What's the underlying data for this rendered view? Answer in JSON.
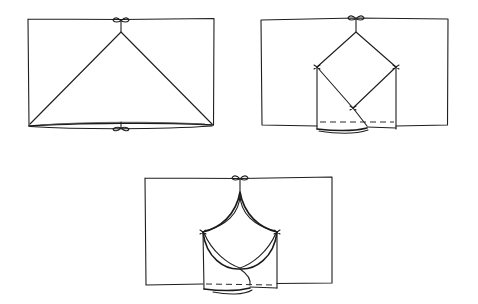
{
  "diagram": {
    "title": "",
    "style": "hand-drawn line sketch",
    "colors": {
      "ink": "#1e1e1e",
      "background": "#ffffff"
    },
    "steps": [
      {
        "id": "step-1",
        "label": "",
        "description": "Rectangle with triangle drawn from top-center bow to both bottom corners; bows at top and bottom center",
        "frame": {
          "x": 28,
          "y": 19,
          "w": 186,
          "h": 107
        },
        "shape": "triangle",
        "points": {
          "apex": [
            121,
            32
          ],
          "left": [
            30,
            124
          ],
          "right": [
            212,
            124
          ]
        },
        "bows": [
          {
            "x": 121,
            "y": 19,
            "position": "top"
          },
          {
            "x": 121,
            "y": 128,
            "position": "bottom"
          }
        ]
      },
      {
        "id": "step-2",
        "label": "",
        "description": "Rectangle with diamond hanging from top-center bow; inner folded panel with dashed fold line at bottom",
        "frame": {
          "x": 261,
          "y": 18,
          "w": 187,
          "h": 107
        },
        "shape": "diamond",
        "points": {
          "top": [
            356,
            32
          ],
          "left": [
            317,
            67
          ],
          "right": [
            396,
            67
          ],
          "bottom": [
            353,
            108
          ]
        },
        "inner_panel": {
          "x": 317,
          "y": 67,
          "w": 79,
          "h": 64
        },
        "fold_line": {
          "style": "dashed",
          "y": 122
        },
        "bows": [
          {
            "x": 356,
            "y": 17,
            "position": "top"
          }
        ]
      },
      {
        "id": "step-3",
        "label": "",
        "description": "Rectangle with scalloped curved canopy hanging from top-center bow; inner folded panel with dashed fold line",
        "frame": {
          "x": 145,
          "y": 178,
          "w": 187,
          "h": 107
        },
        "shape": "curved-canopy",
        "points": {
          "top": [
            240,
            192
          ],
          "left": [
            203,
            232
          ],
          "right": [
            277,
            232
          ],
          "bottom": [
            240,
            269
          ]
        },
        "inner_panel": {
          "x": 203,
          "y": 232,
          "w": 74,
          "h": 62
        },
        "fold_line": {
          "style": "dashed",
          "y": 284
        },
        "bows": [
          {
            "x": 240,
            "y": 177,
            "position": "top"
          }
        ]
      }
    ]
  }
}
